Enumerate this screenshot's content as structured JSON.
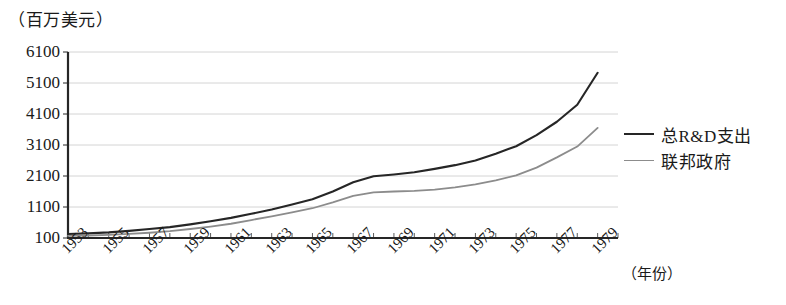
{
  "chart_data": {
    "type": "line",
    "title": "（百万美元）",
    "subtitle": "",
    "xlabel": "（年份）",
    "ylabel": "",
    "ylim": [
      100,
      6100
    ],
    "xlim": [
      1953,
      1980
    ],
    "ytick_values": [
      100,
      1100,
      2100,
      3100,
      4100,
      5100,
      6100
    ],
    "ytick_labels": [
      "100",
      "1100",
      "2100",
      "3100",
      "4100",
      "5100",
      "6100"
    ],
    "xtick_labels": [
      "1953",
      "1955",
      "1957",
      "1959",
      "1961",
      "1963",
      "1965",
      "1967",
      "1969",
      "1971",
      "1973",
      "1975",
      "1977",
      "1979"
    ],
    "xtick_values": [
      1953,
      1955,
      1957,
      1959,
      1961,
      1963,
      1965,
      1967,
      1969,
      1971,
      1973,
      1975,
      1977,
      1979
    ],
    "minor_xticks_every": 1,
    "grid": "horizontal",
    "legend_position": "right",
    "x": [
      1953,
      1954,
      1955,
      1956,
      1957,
      1958,
      1959,
      1960,
      1961,
      1962,
      1963,
      1964,
      1965,
      1966,
      1967,
      1968,
      1969,
      1970,
      1971,
      1972,
      1973,
      1974,
      1975,
      1976,
      1977,
      1978,
      1979
    ],
    "series": [
      {
        "name": "总R&D支出",
        "color": "#262626",
        "width": 2.1,
        "values": [
          230,
          250,
          280,
          330,
          390,
          450,
          540,
          640,
          750,
          880,
          1020,
          1180,
          1350,
          1600,
          1900,
          2090,
          2150,
          2220,
          2330,
          2450,
          2600,
          2820,
          3060,
          3420,
          3850,
          4400,
          5430
        ]
      },
      {
        "name": "联邦政府",
        "color": "#8c8c8c",
        "width": 1.8,
        "values": [
          170,
          180,
          200,
          230,
          270,
          320,
          390,
          470,
          560,
          680,
          800,
          930,
          1060,
          1250,
          1460,
          1570,
          1600,
          1620,
          1660,
          1730,
          1830,
          1960,
          2120,
          2370,
          2700,
          3050,
          3650
        ]
      }
    ]
  },
  "legend": {
    "items": [
      {
        "label": "总R&D支出",
        "color": "#262626"
      },
      {
        "label": "联邦政府",
        "color": "#8c8c8c"
      }
    ]
  }
}
